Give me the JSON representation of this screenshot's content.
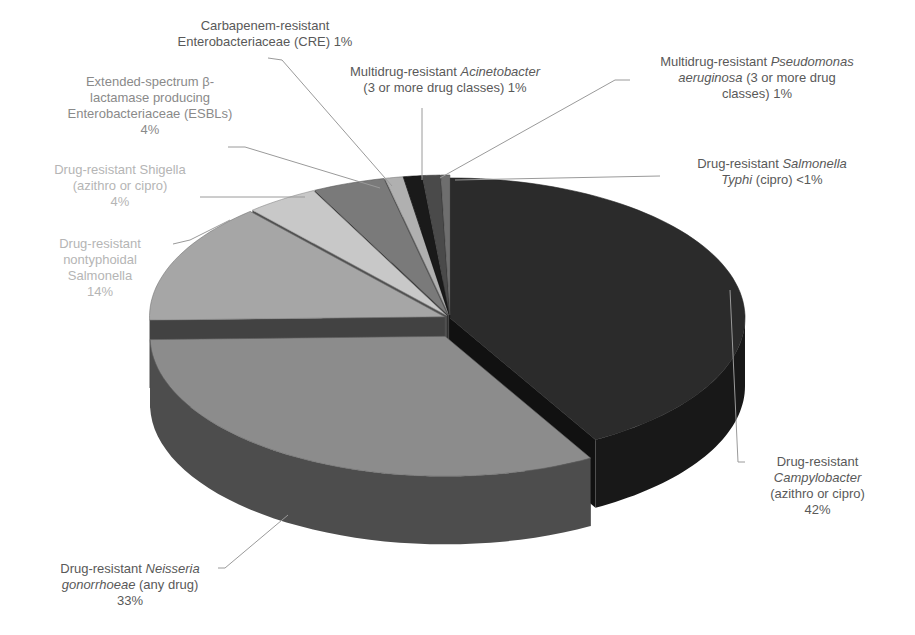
{
  "header": {
    "cropped_text_fragment": "p...g..."
  },
  "chart_data": {
    "type": "pie",
    "style": "3d-pie",
    "title": "",
    "start_angle_deg": 0,
    "direction": "clockwise",
    "slices": [
      {
        "label": "Drug-resistant Campylobacter (azithro or cipro)",
        "value": 42,
        "display": "42%",
        "color": "#2b2b2b"
      },
      {
        "label": "Drug-resistant Neisseria gonorrhoeae (any drug)",
        "value": 33,
        "display": "33%",
        "color": "#8c8c8c"
      },
      {
        "label": "Drug-resistant nontyphoidal Salmonella",
        "value": 14,
        "display": "14%",
        "color": "#a6a6a6"
      },
      {
        "label": "Drug-resistant Shigella (azithro or cipro)",
        "value": 4,
        "display": "4%",
        "color": "#c8c8c8"
      },
      {
        "label": "Extended-spectrum β-lactamase producing Enterobacteriaceae (ESBLs)",
        "value": 4,
        "display": "4%",
        "color": "#7a7a7a"
      },
      {
        "label": "Carbapenem-resistant Enterobacteriaceae (CRE)",
        "value": 1,
        "display": "1%",
        "color": "#b0b0b0"
      },
      {
        "label": "Multidrug-resistant Acinetobacter (3 or more drug classes)",
        "value": 1,
        "display": "1%",
        "color": "#1a1a1a"
      },
      {
        "label": "Multidrug-resistant Pseudomonas aeruginosa (3 or more drug classes)",
        "value": 1,
        "display": "1%",
        "color": "#4a4a4a"
      },
      {
        "label": "Drug-resistant Salmonella Typhi (cipro)",
        "value": 0.5,
        "display": "<1%",
        "color": "#6e6e6e"
      }
    ],
    "legend": "none (data labels with leader lines)"
  },
  "labels": {
    "cre": {
      "line1": "Carbapenem-resistant",
      "line2": "Enterobacteriaceae (CRE) 1%"
    },
    "esbl": {
      "line1": "Extended-spectrum β-",
      "line2": "lactamase producing",
      "line3": "Enterobacteriaceae (ESBLs)",
      "line4": "4%"
    },
    "shigella": {
      "line1": "Drug-resistant Shigella",
      "line2": "(azithro or cipro)",
      "line3": "4%"
    },
    "nts": {
      "line1": "Drug-resistant",
      "line2": "nontyphoidal",
      "line3": "Salmonella",
      "line4": "14%"
    },
    "acinetobacter": {
      "line1a": "Multidrug-resistant ",
      "line1b": "Acinetobacter",
      "line2": "(3 or more drug classes) 1%"
    },
    "pseudomonas": {
      "line1a": "Multidrug-resistant ",
      "line1b": "Pseudomonas",
      "line2a": "aeruginosa",
      "line2b": " (3 or more drug",
      "line3": "classes) 1%"
    },
    "typhi": {
      "line1a": "Drug-resistant ",
      "line1b": "Salmonella",
      "line2a": "Typhi",
      "line2b": " (cipro) <1%"
    },
    "campylobacter": {
      "line1": "Drug-resistant",
      "line2": "Campylobacter",
      "line3": "(azithro or cipro)",
      "line4": "42%"
    },
    "neisseria": {
      "line1a": "Drug-resistant ",
      "line1b": "Neisseria",
      "line2a": "gonorrhoeae",
      "line2b": " (any drug)",
      "line3": "33%"
    }
  }
}
